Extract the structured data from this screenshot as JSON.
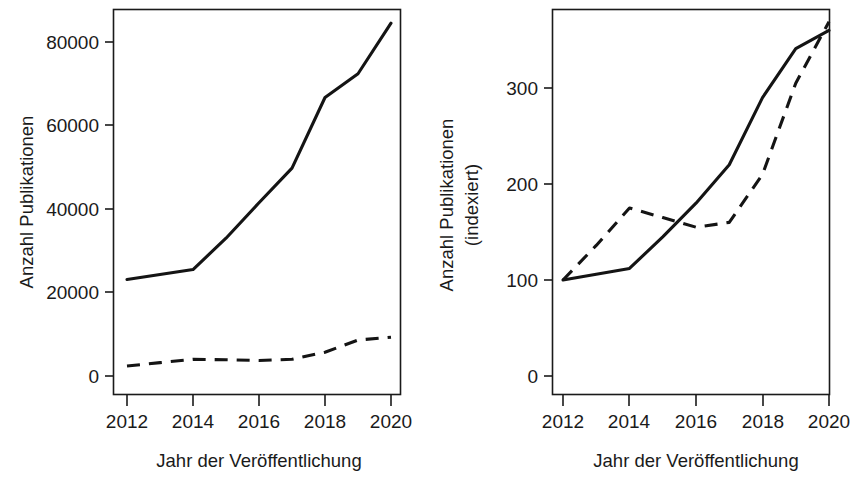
{
  "figure": {
    "background": "#ffffff",
    "ink_color": "#141414",
    "panel_count": 2
  },
  "chart_data": [
    {
      "type": "line",
      "panel": "left",
      "title": "",
      "xlabel": "Jahr der Veröffentlichung",
      "ylabel": "Anzahl Publikationen",
      "x": [
        2012,
        2013,
        2014,
        2015,
        2016,
        2017,
        2018,
        2019,
        2020
      ],
      "xlim": [
        2011.6,
        2020.4
      ],
      "ylim": [
        -3500,
        89000
      ],
      "xticks": [
        2012,
        2014,
        2016,
        2018,
        2020
      ],
      "xtick_labels": [
        "2012",
        "2014",
        "2016",
        "2018",
        "2020"
      ],
      "yticks": [
        0,
        20000,
        40000,
        60000,
        80000
      ],
      "ytick_labels": [
        "0",
        "20000",
        "40000",
        "60000",
        "80000"
      ],
      "grid": false,
      "legend": false,
      "series": [
        {
          "name": "Gesamt (durchgezogen)",
          "style": "solid",
          "values": [
            23100,
            24300,
            25500,
            33000,
            41500,
            49800,
            66700,
            72400,
            84500
          ]
        },
        {
          "name": "Teilmenge (gestrichelt)",
          "style": "dashed",
          "values": [
            2400,
            3200,
            4000,
            3900,
            3700,
            4000,
            5700,
            8600,
            9300
          ]
        }
      ]
    },
    {
      "type": "line",
      "panel": "right",
      "title": "",
      "xlabel": "Jahr der Veröffentlichung",
      "ylabel": "Anzahl Publikationen\n(indexiert)",
      "ylabel_line1": "Anzahl Publikationen",
      "ylabel_line2": "(indexiert)",
      "x": [
        2012,
        2013,
        2014,
        2015,
        2016,
        2017,
        2018,
        2019,
        2020
      ],
      "xlim": [
        2011.6,
        2020.4
      ],
      "ylim": [
        -15,
        385
      ],
      "xticks": [
        2012,
        2014,
        2016,
        2018,
        2020
      ],
      "xtick_labels": [
        "2012",
        "2014",
        "2016",
        "2018",
        "2020"
      ],
      "yticks": [
        0,
        100,
        200,
        300
      ],
      "ytick_labels": [
        "0",
        "100",
        "200",
        "300"
      ],
      "grid": false,
      "legend": false,
      "series": [
        {
          "name": "Gesamt (durchgezogen)",
          "style": "solid",
          "values": [
            100,
            106,
            112,
            145,
            180,
            220,
            290,
            341,
            360
          ]
        },
        {
          "name": "Teilmenge (gestrichelt)",
          "style": "dashed",
          "values": [
            100,
            136,
            175,
            165,
            155,
            160,
            210,
            305,
            369
          ]
        }
      ]
    }
  ]
}
